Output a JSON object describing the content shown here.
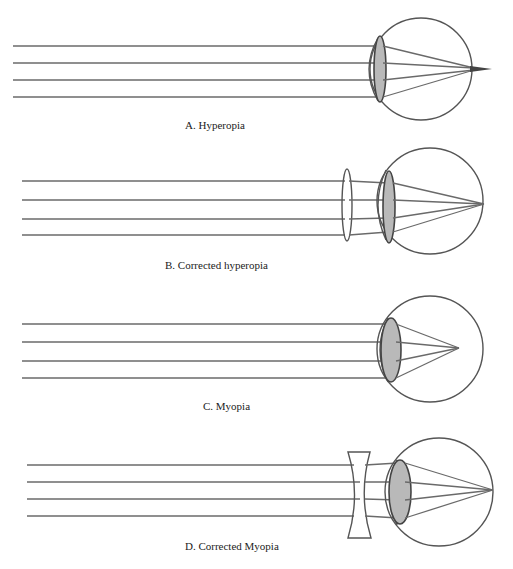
{
  "panels": [
    {
      "id": "A",
      "caption": "A. Hyperopia",
      "condition": "hyperopia",
      "corrective_lens": "none",
      "focus": "behind retina"
    },
    {
      "id": "B",
      "caption": "B. Corrected hyperopia",
      "condition": "hyperopia",
      "corrective_lens": "convex",
      "focus": "on retina"
    },
    {
      "id": "C",
      "caption": "C. Myopia",
      "condition": "myopia",
      "corrective_lens": "none",
      "focus": "in front of retina"
    },
    {
      "id": "D",
      "caption": "D. Corrected Myopia",
      "condition": "myopia",
      "corrective_lens": "concave",
      "focus": "on retina"
    }
  ],
  "colors": {
    "background": "#ffffff",
    "lines": "#555555",
    "lens_fill": "#b9b9b9"
  }
}
